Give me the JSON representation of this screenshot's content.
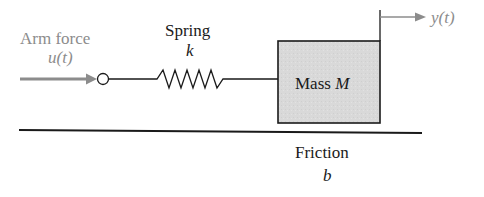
{
  "diagram": {
    "input": {
      "label": "Arm force",
      "symbol": "u(t)",
      "color": "#8c8c8c"
    },
    "spring": {
      "label": "Spring",
      "symbol": "k"
    },
    "mass": {
      "label": "Mass",
      "symbol": "M",
      "fill": "#d9d9d9"
    },
    "output": {
      "symbol": "y(t)",
      "color": "#8c8c8c"
    },
    "friction": {
      "label": "Friction",
      "symbol": "b"
    }
  }
}
